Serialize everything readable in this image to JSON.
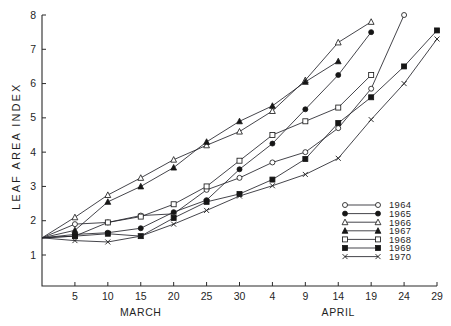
{
  "chart_data": {
    "type": "line",
    "title": "",
    "xlabel": "",
    "ylabel": "LEAF AREA INDEX",
    "xlim": [
      0,
      30
    ],
    "ylim": [
      0.5,
      8.2
    ],
    "grid": false,
    "legend_position": "inside-bottom-right",
    "x_axis": {
      "month_labels": [
        "MARCH",
        "APRIL"
      ],
      "tick_values": [
        5,
        10,
        15,
        20,
        25,
        30,
        4,
        9,
        14,
        19,
        24,
        29
      ],
      "tick_labels": [
        "5",
        "10",
        "15",
        "20",
        "25",
        "30",
        "4",
        "9",
        "14",
        "19",
        "24",
        "29"
      ],
      "tick_days": [
        5,
        10,
        15,
        20,
        25,
        30,
        35,
        40,
        45,
        50,
        55,
        60
      ]
    },
    "y_axis": {
      "tick_values": [
        1,
        2,
        3,
        4,
        5,
        6,
        7,
        8
      ],
      "tick_labels": [
        "1",
        "2",
        "3",
        "4",
        "5",
        "6",
        "7",
        "8"
      ]
    },
    "series": [
      {
        "name": "1964",
        "marker": "open-circle",
        "x": [
          0,
          5,
          10,
          15,
          20,
          25,
          30,
          35,
          40,
          45,
          50,
          55
        ],
        "values": [
          1.5,
          1.9,
          1.95,
          2.15,
          2.2,
          2.9,
          3.25,
          3.7,
          4.0,
          4.7,
          5.85,
          8.0
        ]
      },
      {
        "name": "1965",
        "marker": "filled-circle",
        "x": [
          0,
          5,
          10,
          15,
          20,
          25,
          30,
          35,
          40,
          45,
          50
        ],
        "values": [
          1.5,
          1.6,
          1.65,
          1.78,
          2.25,
          2.6,
          3.5,
          4.25,
          5.25,
          6.25,
          7.5
        ]
      },
      {
        "name": "1966",
        "marker": "open-triangle",
        "x": [
          0,
          5,
          10,
          15,
          20,
          25,
          30,
          35,
          40,
          45,
          50
        ],
        "values": [
          1.5,
          2.1,
          2.75,
          3.25,
          3.78,
          4.2,
          4.6,
          5.2,
          6.1,
          7.2,
          7.8
        ]
      },
      {
        "name": "1967",
        "marker": "filled-triangle",
        "x": [
          0,
          5,
          10,
          15,
          20,
          25,
          30,
          35,
          40,
          45
        ],
        "values": [
          1.5,
          1.72,
          2.55,
          3.0,
          3.55,
          4.3,
          4.9,
          5.35,
          6.05,
          6.65
        ]
      },
      {
        "name": "1968",
        "marker": "open-square",
        "x": [
          0,
          5,
          10,
          15,
          20,
          25,
          30,
          35,
          40,
          45,
          50
        ],
        "values": [
          1.5,
          1.55,
          1.95,
          2.12,
          2.48,
          3.0,
          3.75,
          4.5,
          4.9,
          5.3,
          6.25
        ]
      },
      {
        "name": "1969",
        "marker": "filled-square",
        "x": [
          0,
          5,
          10,
          15,
          20,
          25,
          30,
          35,
          40,
          45,
          50,
          55,
          60
        ],
        "values": [
          1.5,
          1.55,
          1.62,
          1.55,
          2.08,
          2.55,
          2.78,
          3.2,
          3.8,
          4.85,
          5.6,
          6.5,
          7.55
        ]
      },
      {
        "name": "1970",
        "marker": "cross",
        "x": [
          0,
          5,
          10,
          15,
          20,
          25,
          30,
          35,
          40,
          45,
          50,
          55,
          60
        ],
        "values": [
          1.5,
          1.42,
          1.38,
          1.55,
          1.9,
          2.3,
          2.72,
          3.02,
          3.35,
          3.82,
          4.95,
          6.0,
          7.3
        ]
      }
    ]
  },
  "legend": {
    "entries": [
      {
        "label": "1964",
        "marker": "open-circle"
      },
      {
        "label": "1965",
        "marker": "filled-circle"
      },
      {
        "label": "1966",
        "marker": "open-triangle"
      },
      {
        "label": "1967",
        "marker": "filled-triangle"
      },
      {
        "label": "1968",
        "marker": "open-square"
      },
      {
        "label": "1969",
        "marker": "filled-square"
      },
      {
        "label": "1970",
        "marker": "cross"
      }
    ]
  }
}
